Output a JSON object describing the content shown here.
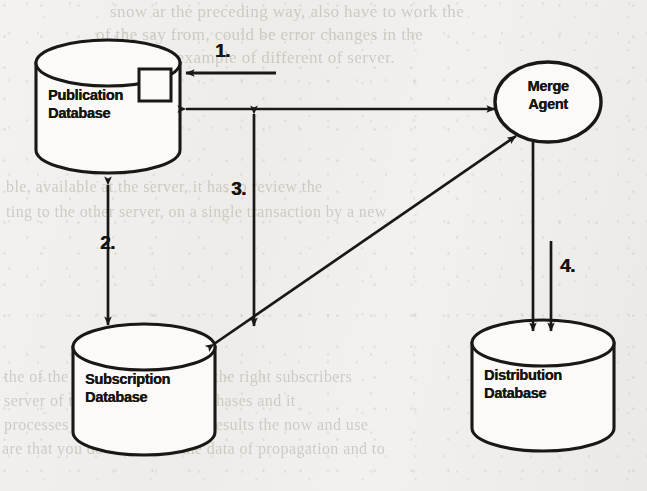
{
  "diagram": {
    "background_color": "#f2f0ee",
    "ink_color": "#1a1814",
    "nodes": [
      {
        "id": "publication-database",
        "shape": "cylinder",
        "line1": "Publication",
        "line2": "Database",
        "has_inner_square": true
      },
      {
        "id": "merge-agent",
        "shape": "ellipse",
        "line1": "Merge",
        "line2": "Agent",
        "has_inner_square": false
      },
      {
        "id": "subscription-database",
        "shape": "cylinder",
        "line1": "Subscription",
        "line2": "Database",
        "has_inner_square": false
      },
      {
        "id": "distribution-database",
        "shape": "cylinder",
        "line1": "Distribution",
        "line2": "Database",
        "has_inner_square": false
      }
    ],
    "connectors": [
      {
        "id": "step-1-arrow",
        "label": "1.",
        "heads": "single",
        "from": "external",
        "to": "publication-database",
        "orientation": "horizontal"
      },
      {
        "id": "step-2-arrow",
        "label": "2.",
        "heads": "double",
        "from": "publication-database",
        "to": "subscription-database",
        "orientation": "vertical"
      },
      {
        "id": "step-3-arrow",
        "label": "3.",
        "heads": "double",
        "from": "publication-merge-link",
        "to": "subscription-database",
        "orientation": "vertical"
      },
      {
        "id": "step-4-arrow",
        "label": "4.",
        "heads": "double-parallel-down",
        "from": "merge-agent",
        "to": "distribution-database",
        "orientation": "vertical"
      },
      {
        "id": "publication-merge-arrow",
        "label": "",
        "heads": "double",
        "from": "publication-database",
        "to": "merge-agent",
        "orientation": "horizontal"
      },
      {
        "id": "subscription-merge-arrow",
        "label": "",
        "heads": "double",
        "from": "subscription-database",
        "to": "merge-agent",
        "orientation": "diagonal"
      }
    ],
    "background_text": {
      "top_line_1": "snow ar the preceding way, also have to work the",
      "top_line_2": "of the say from, could be error changes in the",
      "top_line_3": "the example of different of server.",
      "mid_line_1": "ble, available at the server, it has to review the",
      "mid_line_2": "ting to the other server, on a single transaction by a new",
      "bottom_line_1": "the of the replication, mere all the right subscribers",
      "bottom_line_2": "server of the that respect it in phases and it",
      "bottom_line_3": "processes which you have the results the now and use",
      "bottom_line_4": "are that you do not access the data of propagation and to"
    }
  }
}
